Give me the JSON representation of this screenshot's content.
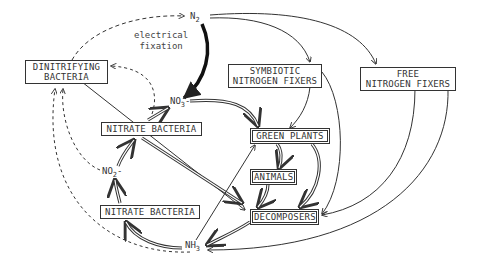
{
  "diagram": {
    "nodes": {
      "n2": {
        "main": "N",
        "sub": "2",
        "suffix": ""
      },
      "no3": {
        "main": "NO",
        "sub": "3",
        "suffix": "-"
      },
      "no2": {
        "main": "NO",
        "sub": "2",
        "suffix": "-"
      },
      "nh3": {
        "main": "NH",
        "sub": "3",
        "suffix": ""
      }
    },
    "boxes": {
      "dinitrifying": {
        "line1": "DINITRIFYING",
        "line2": "BACTERIA"
      },
      "nitrate_top": {
        "line1": "NITRATE BACTERIA"
      },
      "nitrate_bottom": {
        "line1": "NITRATE BACTERIA"
      },
      "symbiotic": {
        "line1": "SYMBIOTIC",
        "line2": "NITROGEN FIXERS"
      },
      "free": {
        "line1": "FREE",
        "line2": "NITROGEN FIXERS"
      },
      "green_plants": {
        "line1": "GREEN PLANTS"
      },
      "animals": {
        "line1": "ANIMALS"
      },
      "decomposers": {
        "line1": "DECOMPOSERS"
      }
    },
    "annotations": {
      "electrical_fixation": {
        "line1": "electrical",
        "line2": "fixation"
      }
    },
    "edges": [
      {
        "from": "N2",
        "to": "NO3-",
        "label": "electrical fixation",
        "style": "bold"
      },
      {
        "from": "N2",
        "to": "SYMBIOTIC NITROGEN FIXERS",
        "style": "solid"
      },
      {
        "from": "N2",
        "to": "FREE NITROGEN FIXERS",
        "style": "solid"
      },
      {
        "from": "DINITRIFYING BACTERIA",
        "to": "N2",
        "style": "dashed"
      },
      {
        "from": "NO3-",
        "to": "DINITRIFYING BACTERIA",
        "style": "dashed"
      },
      {
        "from": "NO2-",
        "to": "DINITRIFYING BACTERIA",
        "style": "dashed"
      },
      {
        "from": "NH3",
        "to": "DINITRIFYING BACTERIA",
        "style": "dashed"
      },
      {
        "from": "NO3-",
        "to": "GREEN PLANTS",
        "style": "double"
      },
      {
        "from": "NITRATE BACTERIA (top)",
        "to": "NO3-",
        "style": "double"
      },
      {
        "from": "NO2-",
        "to": "NITRATE BACTERIA (top)",
        "style": "double"
      },
      {
        "from": "NITRATE BACTERIA (bottom)",
        "to": "NO2-",
        "style": "double"
      },
      {
        "from": "NH3",
        "to": "NITRATE BACTERIA (bottom)",
        "style": "double"
      },
      {
        "from": "SYMBIOTIC NITROGEN FIXERS",
        "to": "GREEN PLANTS",
        "style": "solid"
      },
      {
        "from": "SYMBIOTIC NITROGEN FIXERS",
        "to": "DECOMPOSERS",
        "style": "solid"
      },
      {
        "from": "GREEN PLANTS",
        "to": "ANIMALS",
        "style": "double"
      },
      {
        "from": "GREEN PLANTS",
        "to": "DECOMPOSERS",
        "style": "double"
      },
      {
        "from": "ANIMALS",
        "to": "DECOMPOSERS",
        "style": "double"
      },
      {
        "from": "DINITRIFYING BACTERIA",
        "to": "DECOMPOSERS",
        "style": "solid"
      },
      {
        "from": "NITRATE BACTERIA (top)",
        "to": "DECOMPOSERS",
        "style": "double"
      },
      {
        "from": "NH3",
        "to": "GREEN PLANTS",
        "style": "solid"
      },
      {
        "from": "DECOMPOSERS",
        "to": "NH3",
        "style": "double"
      },
      {
        "from": "FREE NITROGEN FIXERS",
        "to": "DECOMPOSERS",
        "style": "solid"
      },
      {
        "from": "FREE NITROGEN FIXERS",
        "to": "NH3",
        "style": "solid"
      }
    ],
    "colors": {
      "ink": "#333333",
      "background": "#ffffff"
    }
  }
}
